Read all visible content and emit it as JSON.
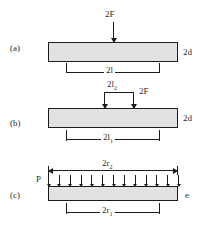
{
  "figure": {
    "panels": [
      {
        "id": "a",
        "label": "(a)",
        "load_label": "2F",
        "thickness_label": "2d",
        "span_label": "2l",
        "load_type": "point",
        "point_loads": 1
      },
      {
        "id": "b",
        "label": "(b)",
        "load_label": "2F",
        "inner_span_label": "2l₂",
        "inner_span_base": "2l",
        "inner_span_sub": "2",
        "thickness_label": "2d",
        "span_label": "2l₁",
        "span_base": "2l",
        "span_sub": "1",
        "load_type": "bracket-pair",
        "point_loads": 2
      },
      {
        "id": "c",
        "label": "(c)",
        "left_end_label": "P",
        "right_end_label": "e",
        "outer_dim_label": "2r₂",
        "outer_dim_base": "2r",
        "outer_dim_sub": "2",
        "inner_dim_label": "2r₁",
        "inner_dim_base": "2r",
        "inner_dim_sub": "1",
        "load_type": "distributed",
        "arrow_count": 13
      }
    ],
    "colors": {
      "beam_fill": "#e2e2e2",
      "line": "#1c1c1c",
      "text": "#2a2a2a",
      "background": "#ffffff"
    }
  }
}
